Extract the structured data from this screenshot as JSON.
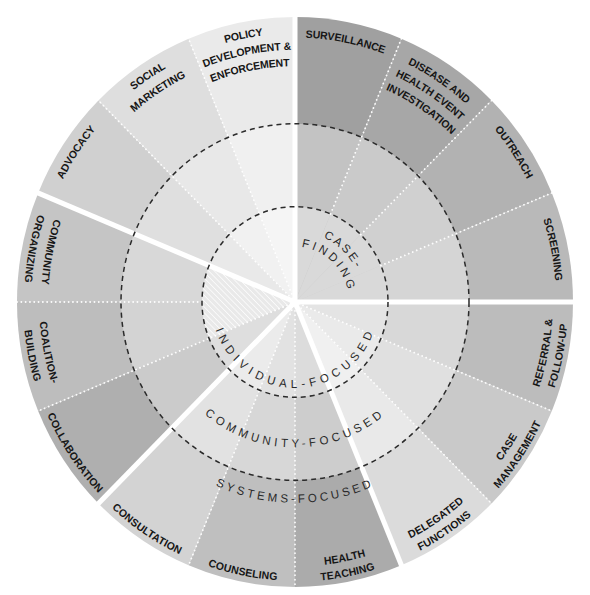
{
  "wheel": {
    "levels": {
      "individual": "INDIVIDUAL-FOCUSED",
      "community": "COMMUNITY-FOCUSED",
      "systems": "SYSTEMS-FOCUSED"
    },
    "case_finding_label": [
      "CASE-",
      "FINDING"
    ],
    "separator_color": "#ffffff",
    "level_boundary_color": "#2b2b2b",
    "interventions": [
      {
        "group": 1,
        "lines": [
          "SURVEILLANCE"
        ],
        "colors": {
          "systems": "#a0a0a0",
          "community": "#c3c3c3",
          "individual": "#d9d9d9"
        }
      },
      {
        "group": 1,
        "lines": [
          "DISEASE AND",
          "HEALTH EVENT",
          "INVESTIGATION"
        ],
        "colors": {
          "systems": "#a7a7a7",
          "community": "#cacaca",
          "individual": "#d9d9d9"
        }
      },
      {
        "group": 1,
        "lines": [
          "OUTREACH"
        ],
        "colors": {
          "systems": "#b2b2b2",
          "community": "#d0d0d0",
          "individual": "#d9d9d9"
        }
      },
      {
        "group": 1,
        "lines": [
          "SCREENING"
        ],
        "colors": {
          "systems": "#b9b9b9",
          "community": "#d5d5d5",
          "individual": "#d9d9d9"
        }
      },
      {
        "group": 2,
        "lines": [
          "REFERRAL &",
          "FOLLOW-UP"
        ],
        "colors": {
          "systems": "#bcbcbc",
          "community": "#d8d8d8",
          "individual": "#e4e4e4"
        }
      },
      {
        "group": 2,
        "lines": [
          "CASE",
          "MANAGEMENT"
        ],
        "colors": {
          "systems": "#c9c9c9",
          "community": "#e0e0e0",
          "individual": "#eaeaea"
        }
      },
      {
        "group": 2,
        "lines": [
          "DELEGATED",
          "FUNCTIONS"
        ],
        "colors": {
          "systems": "#dbdbdb",
          "community": "#e9e9e9",
          "individual": "#f0f0f0"
        }
      },
      {
        "group": 3,
        "lines": [
          "HEALTH",
          "TEACHING"
        ],
        "colors": {
          "systems": "#ababab",
          "community": "#cdcdcd",
          "individual": "#dcdcdc"
        }
      },
      {
        "group": 3,
        "lines": [
          "COUNSELING"
        ],
        "colors": {
          "systems": "#bfbfbf",
          "community": "#d7d7d7",
          "individual": "#e2e2e2"
        }
      },
      {
        "group": 3,
        "lines": [
          "CONSULTATION"
        ],
        "colors": {
          "systems": "#d3d3d3",
          "community": "#e2e2e2",
          "individual": "#ebebeb"
        }
      },
      {
        "group": 4,
        "lines": [
          "COLLABORATION"
        ],
        "colors": {
          "systems": "#afafaf",
          "community": "#cbcbcb",
          "individual": "#dedede"
        }
      },
      {
        "group": 4,
        "lines": [
          "COALITION-",
          "BUILDING"
        ],
        "colors": {
          "systems": "#bdbdbd",
          "community": "#d3d3d3",
          "individual": "hatched"
        }
      },
      {
        "group": 4,
        "lines": [
          "COMMUNITY",
          "ORGANIZING"
        ],
        "colors": {
          "systems": "#c5c5c5",
          "community": "#d8d8d8",
          "individual": "hatched"
        }
      },
      {
        "group": 5,
        "lines": [
          "ADVOCACY"
        ],
        "colors": {
          "systems": "#d0d0d0",
          "community": "#dfdfdf",
          "individual": "#e9e9e9"
        }
      },
      {
        "group": 5,
        "lines": [
          "SOCIAL",
          "MARKETING"
        ],
        "colors": {
          "systems": "#dedede",
          "community": "#e8e8e8",
          "individual": "#f1f1f1"
        }
      },
      {
        "group": 5,
        "lines": [
          "POLICY",
          "DEVELOPMENT &",
          "ENFORCEMENT"
        ],
        "colors": {
          "systems": "#eaeaea",
          "community": "#f0f0f0",
          "individual": "#f5f5f5"
        }
      }
    ]
  }
}
